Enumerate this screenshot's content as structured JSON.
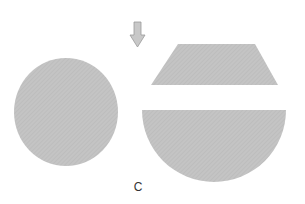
{
  "figure": {
    "label": "C",
    "colors": {
      "shape_fill": "#c4c4c4",
      "hatch": "#b6b6b6",
      "arrow_fill": "#c8c8c8",
      "arrow_stroke": "#9a9a9a",
      "background": "#ffffff"
    },
    "shapes": [
      {
        "name": "circle",
        "kind": "ellipse",
        "cx": 66,
        "cy": 112,
        "rx": 52,
        "ry": 54
      },
      {
        "name": "trapezoid",
        "kind": "polygon",
        "points": "178,44 255,44 278,85 151,85"
      },
      {
        "name": "circular-segment",
        "kind": "segment",
        "x1": 142,
        "x2": 286,
        "top": 110,
        "bottom": 177
      }
    ],
    "arrow": {
      "direction": "down",
      "x": 137,
      "y_top": 22,
      "y_tip": 47
    }
  }
}
